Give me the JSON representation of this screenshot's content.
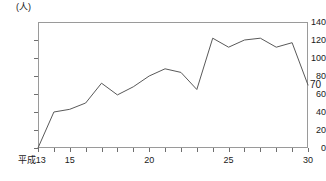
{
  "chart_data": {
    "type": "line",
    "title": "",
    "xlabel": "",
    "ylabel": "",
    "unit_label": "(人)",
    "era_prefix": "平成",
    "grid": false,
    "legend": "none",
    "ylim": [
      0,
      140
    ],
    "yticks": [
      0,
      20,
      40,
      60,
      80,
      100,
      120,
      140
    ],
    "ytick_labels": [
      "0",
      "20",
      "40",
      "60",
      "80",
      "100",
      "120",
      "140"
    ],
    "xlim": [
      13,
      30
    ],
    "xticks": [
      13,
      14,
      15,
      16,
      17,
      18,
      19,
      20,
      21,
      22,
      23,
      24,
      25,
      26,
      27,
      28,
      29,
      30
    ],
    "xtick_labels": [
      {
        "value": 13,
        "label": "平成13"
      },
      {
        "value": 15,
        "label": "15"
      },
      {
        "value": 20,
        "label": "20"
      },
      {
        "value": 25,
        "label": "25"
      },
      {
        "value": 30,
        "label": "30"
      }
    ],
    "categories": [
      13,
      14,
      15,
      16,
      17,
      18,
      19,
      20,
      21,
      22,
      23,
      24,
      25,
      26,
      27,
      28,
      29,
      30
    ],
    "values": [
      0,
      40,
      43,
      50,
      72,
      59,
      68,
      80,
      88,
      84,
      65,
      122,
      112,
      120,
      122,
      112,
      117,
      70
    ],
    "annotations": [
      {
        "text": "70",
        "at_x": 30,
        "at_y": 70,
        "position": "right"
      }
    ]
  },
  "figure": {
    "unit_label": "(人)",
    "end_value_label": "70"
  }
}
